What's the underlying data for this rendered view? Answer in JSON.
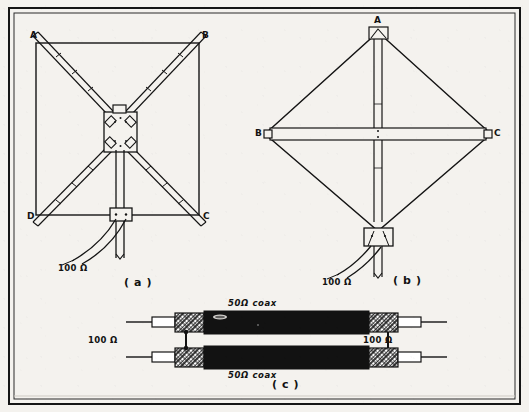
{
  "figure": {
    "background_color": "#f4f2ee",
    "ink_color": "#121212",
    "border": "thin black rectangle frame"
  },
  "panels": [
    {
      "id": "a",
      "caption": "( a )",
      "description": "Square quad loop on X-shaped spreaders with center hub plate",
      "corner_labels": [
        "A",
        "B",
        "C",
        "D"
      ],
      "corner_positions": [
        "top-left",
        "top-right",
        "bottom-right",
        "bottom-left"
      ],
      "feed_label": "100 Ω",
      "hub": "square center plate with four bolted clamps",
      "mast": "vertical mast below hub"
    },
    {
      "id": "b",
      "caption": "( b )",
      "description": "Diamond (rotated square) quad loop on cross spreaders",
      "corner_labels": [
        "A",
        "B",
        "C"
      ],
      "corner_positions": [
        "top",
        "left",
        "right"
      ],
      "feed_label": "100 Ω",
      "hub": "feed box at bottom vertex",
      "mast": "vertical spreader through center"
    },
    {
      "id": "c",
      "caption": "( c )",
      "description": "Two parallel quarter-wave 50 ohm coax sections forming a matching transformer",
      "coax_top_label": "50Ω coax",
      "coax_bottom_label": "50Ω coax",
      "left_port_label": "100 Ω",
      "right_port_label": "100 Ω",
      "braid_sections": 4,
      "shield_straps": 2
    }
  ],
  "labels": {
    "a_A": "A",
    "a_B": "B",
    "a_C": "C",
    "a_D": "D",
    "a_ohm": "100 Ω",
    "a_caption": "( a )",
    "b_A": "A",
    "b_B": "B",
    "b_C": "C",
    "b_ohm": "100 Ω",
    "b_caption": "( b )",
    "c_coax_top": "50Ω coax",
    "c_coax_bottom": "50Ω coax",
    "c_ohm_left": "100 Ω",
    "c_ohm_right": "100 Ω",
    "c_caption": "( c )"
  }
}
